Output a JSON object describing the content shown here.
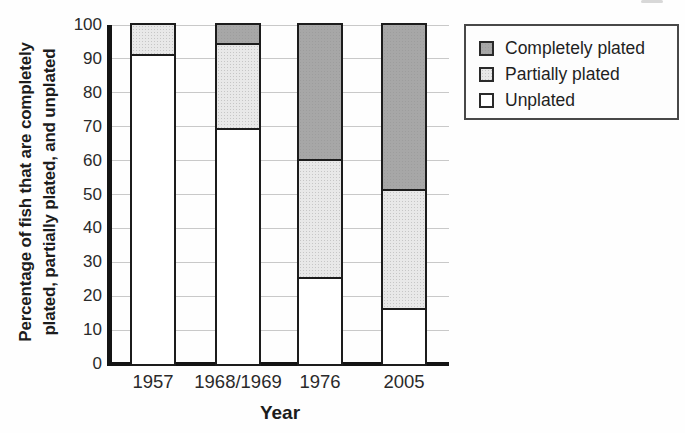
{
  "chart_data": {
    "type": "bar",
    "stacked": true,
    "xlabel": "Year",
    "ylabel": "Percentage of fish that are completely plated, partially plated, and unplated",
    "ylabel_lines": [
      "Percentage of fish that are completely",
      "plated, partially plated, and unplated"
    ],
    "categories": [
      "1957",
      "1968/1969",
      "1976",
      "2005"
    ],
    "series": [
      {
        "name": "Unplated",
        "values": [
          91,
          69,
          25,
          16
        ],
        "fill": "white"
      },
      {
        "name": "Partially plated",
        "values": [
          9,
          25,
          35,
          35
        ],
        "fill": "stipple"
      },
      {
        "name": "Completely plated",
        "values": [
          0,
          6,
          40,
          49
        ],
        "fill": "dark"
      }
    ],
    "ylim": [
      0,
      100
    ],
    "yticks": [
      0,
      10,
      20,
      30,
      40,
      50,
      60,
      70,
      80,
      90,
      100
    ],
    "grid": true,
    "legend_position": "outside-top-right",
    "legend_items": [
      "Completely plated",
      "Partially plated",
      "Unplated"
    ],
    "colors": {
      "completely_plated": "#a7a7a7",
      "partially_plated": "#e8e8e8",
      "unplated": "#ffffff",
      "bar_border": "#1c1c1c",
      "gridline": "#c9c9c9",
      "axis": "#141414"
    }
  }
}
